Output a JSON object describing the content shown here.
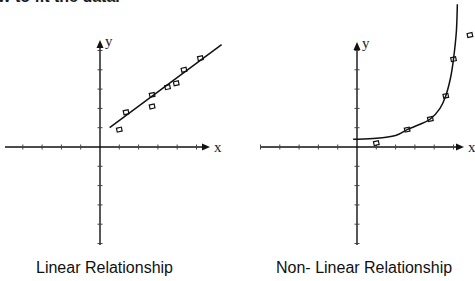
{
  "header": {
    "text": "w to fit the data."
  },
  "chart_data": [
    {
      "type": "scatter",
      "title": "Linear Relationship",
      "xlabel": "x",
      "ylabel": "y",
      "xlim": [
        -5,
        5
      ],
      "ylim": [
        -5,
        5
      ],
      "grid": false,
      "ticks": "unlabeled, 1 unit spacing",
      "series": [
        {
          "name": "data points",
          "marker": "square",
          "points": [
            [
              1.0,
              0.9
            ],
            [
              1.35,
              1.8
            ],
            [
              2.7,
              2.7
            ],
            [
              2.7,
              2.1
            ],
            [
              3.5,
              3.1
            ],
            [
              3.95,
              3.3
            ],
            [
              4.35,
              4.0
            ],
            [
              5.2,
              4.6
            ]
          ]
        },
        {
          "name": "fitted line",
          "kind": "line",
          "points": [
            [
              0.5,
              1.0
            ],
            [
              6.3,
              5.3
            ]
          ]
        }
      ]
    },
    {
      "type": "scatter",
      "title": "Non- Linear Relationship",
      "xlabel": "x",
      "ylabel": "y",
      "xlim": [
        -5,
        5
      ],
      "ylim": [
        -5,
        5
      ],
      "grid": false,
      "ticks": "unlabeled, 1 unit spacing",
      "series": [
        {
          "name": "data points",
          "marker": "square",
          "points": [
            [
              1.0,
              0.2
            ],
            [
              2.6,
              0.9
            ],
            [
              3.8,
              1.45
            ],
            [
              4.6,
              2.65
            ],
            [
              5.0,
              4.55
            ],
            [
              5.85,
              5.8
            ]
          ]
        },
        {
          "name": "fitted curve",
          "kind": "curve",
          "points": [
            [
              -0.2,
              0.4
            ],
            [
              1.0,
              0.45
            ],
            [
              2.0,
              0.6
            ],
            [
              2.6,
              0.9
            ],
            [
              3.2,
              1.15
            ],
            [
              3.8,
              1.45
            ],
            [
              4.3,
              2.0
            ],
            [
              4.6,
              2.65
            ],
            [
              4.85,
              3.6
            ],
            [
              5.0,
              4.55
            ],
            [
              5.15,
              6.0
            ],
            [
              5.2,
              7.4
            ]
          ]
        }
      ]
    }
  ],
  "captions": {
    "left": "Linear Relationship",
    "right": "Non- Linear Relationship"
  },
  "axis_labels": {
    "x": "x",
    "y": "y"
  },
  "colors": {
    "ink": "#111111",
    "background": "#ffffff"
  }
}
